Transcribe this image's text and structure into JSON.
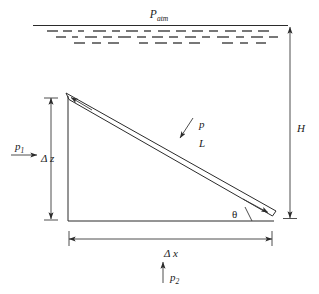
{
  "figure": {
    "background_color": "#ffffff",
    "line_color": "#2b2b2b",
    "text_color": "#1a1a1a"
  },
  "labels": {
    "p_atm": {
      "base": "P",
      "subscript": "atm",
      "description": "atmospheric pressure at free surface"
    },
    "p1": {
      "base": "p",
      "subscript": "1",
      "description": "pressure acting on left vertical face"
    },
    "p2": {
      "base": "p",
      "subscript": "2",
      "description": "pressure acting upward on bottom face"
    },
    "pressure_on_plate": {
      "base": "p",
      "description": "pressure normal to inclined plate"
    },
    "plate_length": {
      "base": "L",
      "description": "length of inclined plate"
    },
    "delta_z": {
      "base": "Δ z",
      "description": "vertical rise dimension"
    },
    "delta_x": {
      "base": "Δ x",
      "description": "horizontal run dimension"
    },
    "depth_H": {
      "base": "H",
      "description": "depth from free surface to lower plate end"
    },
    "theta": {
      "base": "θ",
      "description": "inclination angle of plate from horizontal"
    }
  },
  "free_surface": {
    "line_label": "free-surface-line",
    "hatch_rows": 3,
    "hatch_description": "dashed hatching below free surface indicating liquid"
  },
  "geometry": {
    "apex_top": {
      "x": 68,
      "y": 96
    },
    "corner_bottom_left": {
      "x": 68,
      "y": 221
    },
    "corner_bottom_right": {
      "x": 272,
      "y": 221
    },
    "plate_lower_end": {
      "x": 272,
      "y": 213
    }
  }
}
